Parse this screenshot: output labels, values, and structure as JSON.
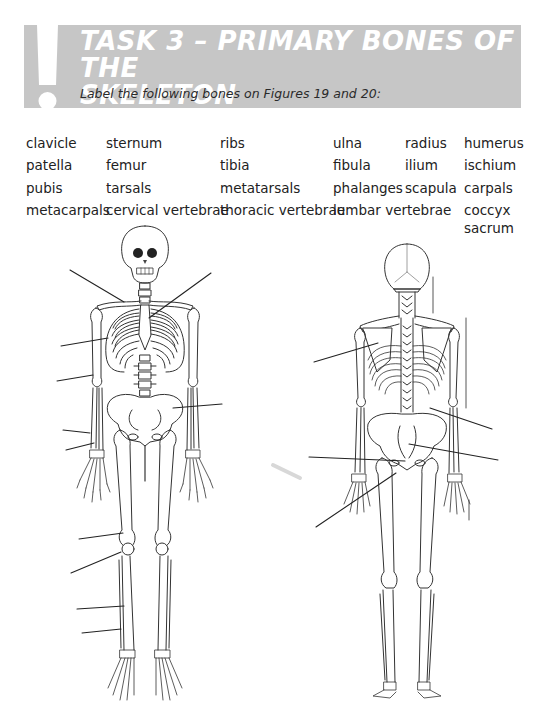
{
  "header": {
    "title_line1": "TASK 3 – PRIMARY BONES OF THE",
    "title_line2": "SKELETON",
    "instruction": "Label the following bones on Figures 19 and 20:",
    "banner_color": "#c6c6c6",
    "icon": "exclamation-icon"
  },
  "word_bank": {
    "rows": [
      [
        "clavicle",
        "sternum",
        "ribs",
        "ulna",
        "radius",
        "humerus"
      ],
      [
        "patella",
        "femur",
        "tibia",
        "fibula",
        "ilium",
        "ischium"
      ],
      [
        "pubis",
        "tarsals",
        "metatarsals",
        "phalanges",
        "scapula",
        "carpals"
      ],
      [
        "metacarpals",
        "cervical vertebrae",
        "thoracic vertebrae",
        "lumbar vertebrae",
        "",
        "coccyx"
      ],
      [
        "",
        "",
        "",
        "",
        "",
        "sacrum"
      ]
    ]
  },
  "figures": [
    {
      "name": "Figure 19",
      "view": "anterior skeleton",
      "label_lines": 12
    },
    {
      "name": "Figure 20",
      "view": "posterior skeleton",
      "label_lines": 6
    }
  ]
}
